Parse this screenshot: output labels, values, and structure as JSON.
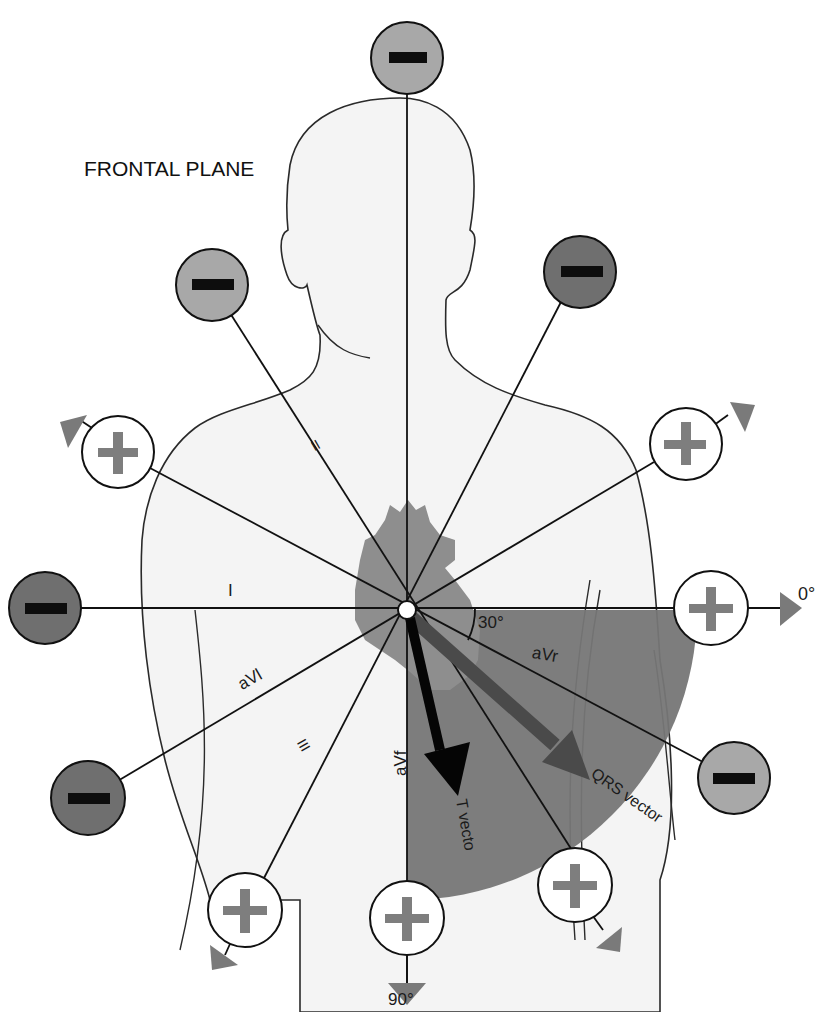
{
  "title": "FRONTAL PLANE",
  "center": {
    "x": 407,
    "y": 610
  },
  "colors": {
    "body_fill": "#f4f4f4",
    "body_outline": "#2a2a2a",
    "heart": "#8e8e8e",
    "sector": "#767676",
    "electrode_light": "#a8a8a8",
    "electrode_dark": "#6f6f6f",
    "electrode_plus_fill": "#ffffff",
    "plus_sign": "#7e7e7e",
    "minus_sign": "#0d0d0d",
    "arrow_head": "#7a7a7a",
    "qrs_vector": "#4a4a4a",
    "t_vector": "#050505",
    "axis_line": "#111111"
  },
  "lead_labels": {
    "I": "I",
    "II": "II",
    "III": "III",
    "aVl": "aVl",
    "aVr": "aVr",
    "aVf": "aVf"
  },
  "angle_labels": {
    "zero": "0°",
    "ninety": "90°",
    "thirty": "30°"
  },
  "vectors": {
    "qrs_label": "QRS vector",
    "t_label": "T vecto"
  },
  "electrodes": [
    {
      "id": "top",
      "sign": "minus",
      "shade": "light",
      "x": 407,
      "y": 58
    },
    {
      "id": "upper-left",
      "sign": "minus",
      "shade": "light",
      "x": 212,
      "y": 285
    },
    {
      "id": "upper-right",
      "sign": "minus",
      "shade": "dark",
      "x": 580,
      "y": 272
    },
    {
      "id": "left-plus",
      "sign": "plus",
      "shade": "white",
      "x": 118,
      "y": 452
    },
    {
      "id": "right-plus",
      "sign": "plus",
      "shade": "white",
      "x": 686,
      "y": 444
    },
    {
      "id": "far-left",
      "sign": "minus",
      "shade": "dark",
      "x": 45,
      "y": 608
    },
    {
      "id": "zero-plus",
      "sign": "plus",
      "shade": "white",
      "x": 711,
      "y": 608
    },
    {
      "id": "lower-left",
      "sign": "minus",
      "shade": "dark",
      "x": 88,
      "y": 798
    },
    {
      "id": "lower-right",
      "sign": "minus",
      "shade": "light",
      "x": 734,
      "y": 778
    },
    {
      "id": "bottom-left-plus",
      "sign": "plus",
      "shade": "white",
      "x": 245,
      "y": 910
    },
    {
      "id": "bottom-plus",
      "sign": "plus",
      "shade": "white",
      "x": 407,
      "y": 918
    },
    {
      "id": "bottom-right-plus",
      "sign": "plus",
      "shade": "white",
      "x": 575,
      "y": 885
    }
  ]
}
